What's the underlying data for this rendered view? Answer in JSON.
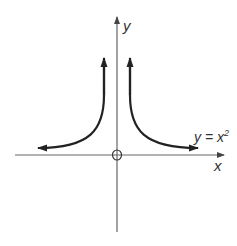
{
  "diagram": {
    "type": "function-graph",
    "axes": {
      "x_label": "x",
      "y_label": "y",
      "origin_label": "O"
    },
    "curve": {
      "label_lhs": "y = x",
      "label_exp": "2",
      "branches": [
        "left",
        "right"
      ]
    },
    "colors": {
      "axis": "#555555",
      "curve": "#222222",
      "text": "#333333",
      "background": "#ffffff"
    }
  }
}
